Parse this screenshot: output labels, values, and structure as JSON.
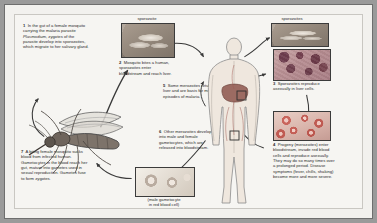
{
  "figure": {
    "background_color": "#f6f5f2",
    "text_color": "#2b2b2b",
    "border_color": "#6e6e6e"
  },
  "labels": {
    "sporozoite": "sporozoite",
    "sporozoites": "sporozoites",
    "gametocyte_caption_line1": "(male gametocyte",
    "gametocyte_caption_line2": "in red blood cell)"
  },
  "steps": [
    {
      "number": "1",
      "text": "In the gut of a female mosquito carrying the malaria parasite Plasmodium, zygotes of the parasite develop into sporozoites, which migrate to her salivary gland.",
      "html": "<span class=\"n\">1</span>&nbsp; In the gut of a female mosquito carrying the malaria parasite <i>Plasmodium</i>, zygotes of the parasite develop into sporozoites, which migrate to her salivary gland."
    },
    {
      "number": "2",
      "text": "Mosquito bites a human, sporozoites enter bloodstream and reach liver.",
      "html": "<span class=\"n\">2</span>&nbsp; Mosquito bites a human, sporozoites enter bloodstream and reach liver."
    },
    {
      "number": "3",
      "text": "Sporozoites reproduce asexually in liver cells.",
      "html": "<span class=\"n\">3</span>&nbsp; Sporozoites reproduce asexually in liver cells."
    },
    {
      "number": "4",
      "text": "Progeny (merozoites) enter bloodstream, invade red blood cells and reproduce asexually. They may do so many times over a prolonged period. Disease symptoms (fever, chills, shaking) become more and more severe.",
      "html": "<span class=\"n\">4</span>&nbsp; Progeny (merozoites) enter bloodstream, invade red blood cells and reproduce asexually. They may do so many times over a prolonged period. Disease symptoms (fever, chills, shaking) become more and more severe."
    },
    {
      "number": "5",
      "text": "Some merozoites return to liver and are basis for more episodes of malaria.",
      "html": "<span class=\"n\">5</span>&nbsp; Some merozoites return to liver and are basis for more episodes of malaria."
    },
    {
      "number": "6",
      "text": "Other merozoites develop into male and female gametocytes, which are released into bloodstream.",
      "html": "<span class=\"n\">6</span>&nbsp; Other merozoites develop into male and female gametocytes, which are released into bloodstream."
    },
    {
      "number": "7",
      "text": "A biting female mosquito sucks blood from infected human. Gametocytes in the blood reach her gut, mature into gametes used in sexual reproduction. Gametes fuse to form zygotes.",
      "html": "<span class=\"n\">7</span>&nbsp; A biting female mosquito sucks blood from infected human. Gametocytes in the blood reach her gut, mature into gametes used in sexual reproduction. Gametes fuse to form zygotes."
    }
  ],
  "images": {
    "sporozoite_micrograph": "sporozoite-micrograph",
    "sporozoites_micrograph": "sporozoites-micrograph",
    "liver_cells_micrograph": "liver-cells-micrograph",
    "red_blood_cells_micrograph": "red-blood-cells-micrograph",
    "gametocyte_micrograph": "gametocyte-in-red-blood-cell-micrograph",
    "human_body_illustration": "human-body-illustration",
    "mosquito_illustration": "mosquito-illustration"
  }
}
